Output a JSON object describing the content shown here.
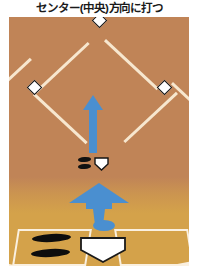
{
  "title": "センター(中央)方向に打つ",
  "diagram": {
    "type": "baseball-field-diagram",
    "sport": "baseball",
    "field": {
      "infield_color": "#c08457",
      "closeup_color": "#d4a24a",
      "line_color": "#f7e7cf"
    },
    "bases": [
      {
        "name": "second-base",
        "label": "2nd"
      },
      {
        "name": "third-base",
        "label": "3rd"
      },
      {
        "name": "first-base",
        "label": "1st"
      },
      {
        "name": "home-plate",
        "label": "Home"
      }
    ],
    "arrows": [
      {
        "name": "hit-direction-arrow-upper",
        "direction": "up",
        "color": "#4a8fd0"
      },
      {
        "name": "hit-direction-arrow-lower",
        "direction": "up",
        "color": "#4a8fd0"
      }
    ],
    "markers": {
      "ball": {
        "name": "ball-marker",
        "color": "#4a8fd0"
      },
      "batter_feet": {
        "name": "batter-footprints",
        "color": "#0d0d0d",
        "count": 2
      },
      "batter_box_side": "left"
    }
  }
}
